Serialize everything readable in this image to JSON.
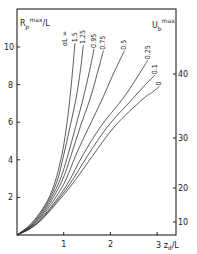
{
  "chart_data": {
    "type": "line",
    "title": "",
    "xlabel": "z_d/L",
    "ylabel": "R_p^max/L",
    "y2label": "U_b^max",
    "xlim": [
      0,
      3.4
    ],
    "ylim": [
      0,
      11.5
    ],
    "x_ticks": [
      1,
      2,
      3
    ],
    "x_tick_labels": [
      "1",
      "2",
      "3"
    ],
    "y_ticks": [
      2,
      4,
      6,
      8,
      10
    ],
    "y_tick_labels": [
      "2",
      "4",
      "6",
      "8",
      "10"
    ],
    "y2_ticks": [
      {
        "label": "10",
        "y_left_equiv": 0.7
      },
      {
        "label": "20",
        "y_left_equiv": 2.5
      },
      {
        "label": "30",
        "y_left_equiv": 5.2
      },
      {
        "label": "40",
        "y_left_equiv": 8.6
      }
    ],
    "grid": false,
    "legend_title": "αL =",
    "series": [
      {
        "name": "1.5",
        "label": "1.5",
        "points": [
          [
            0,
            0
          ],
          [
            0.3,
            0.6
          ],
          [
            0.6,
            1.6
          ],
          [
            0.8,
            2.7
          ],
          [
            0.96,
            4.25
          ],
          [
            1.05,
            5.6
          ],
          [
            1.13,
            7.2
          ],
          [
            1.2,
            9.0
          ],
          [
            1.24,
            10.2
          ]
        ]
      },
      {
        "name": "1.25",
        "label": "1.25",
        "points": [
          [
            0,
            0
          ],
          [
            0.3,
            0.55
          ],
          [
            0.6,
            1.5
          ],
          [
            0.85,
            2.8
          ],
          [
            1.0,
            4.25
          ],
          [
            1.13,
            5.7
          ],
          [
            1.26,
            7.2
          ],
          [
            1.36,
            8.8
          ],
          [
            1.42,
            10.1
          ]
        ]
      },
      {
        "name": "0.95",
        "label": "0.95",
        "points": [
          [
            0,
            0
          ],
          [
            0.3,
            0.5
          ],
          [
            0.6,
            1.4
          ],
          [
            0.9,
            2.8
          ],
          [
            1.09,
            4.25
          ],
          [
            1.26,
            5.8
          ],
          [
            1.41,
            7.2
          ],
          [
            1.55,
            8.7
          ],
          [
            1.65,
            9.9
          ]
        ]
      },
      {
        "name": "0.75",
        "label": "0.75",
        "points": [
          [
            0,
            0
          ],
          [
            0.3,
            0.48
          ],
          [
            0.6,
            1.3
          ],
          [
            0.95,
            2.8
          ],
          [
            1.16,
            4.25
          ],
          [
            1.36,
            5.8
          ],
          [
            1.56,
            7.2
          ],
          [
            1.72,
            8.6
          ],
          [
            1.85,
            9.8
          ]
        ]
      },
      {
        "name": "0.5",
        "label": "0.5",
        "points": [
          [
            0,
            0
          ],
          [
            0.3,
            0.45
          ],
          [
            0.6,
            1.2
          ],
          [
            1.0,
            2.7
          ],
          [
            1.26,
            4.25
          ],
          [
            1.55,
            5.8
          ],
          [
            1.82,
            7.2
          ],
          [
            2.05,
            8.5
          ],
          [
            2.3,
            9.8
          ]
        ]
      },
      {
        "name": "0.25",
        "label": "0.25",
        "points": [
          [
            0,
            0
          ],
          [
            0.3,
            0.4
          ],
          [
            0.6,
            1.1
          ],
          [
            1.05,
            2.6
          ],
          [
            1.41,
            4.25
          ],
          [
            1.8,
            5.8
          ],
          [
            2.25,
            7.2
          ],
          [
            2.55,
            8.3
          ],
          [
            2.8,
            9.3
          ]
        ]
      },
      {
        "name": "0.1",
        "label": "0.1",
        "points": [
          [
            0,
            0
          ],
          [
            0.3,
            0.38
          ],
          [
            0.6,
            1.05
          ],
          [
            1.1,
            2.6
          ],
          [
            1.52,
            4.25
          ],
          [
            1.95,
            5.8
          ],
          [
            2.46,
            7.2
          ],
          [
            2.75,
            8.0
          ],
          [
            2.95,
            8.5
          ]
        ]
      },
      {
        "name": "0",
        "label": "0",
        "points": [
          [
            0,
            0
          ],
          [
            0.3,
            0.36
          ],
          [
            0.6,
            1.0
          ],
          [
            1.15,
            2.6
          ],
          [
            1.63,
            4.25
          ],
          [
            2.1,
            5.8
          ],
          [
            2.68,
            7.2
          ],
          [
            2.9,
            7.6
          ],
          [
            3.05,
            7.9
          ]
        ]
      }
    ]
  }
}
